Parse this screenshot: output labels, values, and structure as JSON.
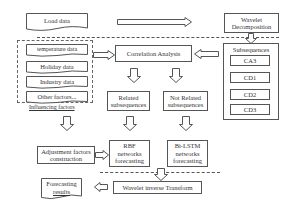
{
  "load_data": "Load data",
  "wavelet_decomposition": [
    "Wavelet",
    "Decomposition"
  ],
  "influencing": {
    "items": [
      "temperature data",
      "Holiday data",
      "Industry data",
      "Other factors..."
    ],
    "label": "Influencing factors"
  },
  "correlation_analysis": "Correlation Analysis",
  "subsequences": {
    "title": "Subsequences",
    "items": [
      "CA3",
      "CD1",
      "CD2",
      "CD3"
    ]
  },
  "related": [
    "Related",
    "subsequences"
  ],
  "not_related": [
    "Not Related",
    "subsequences"
  ],
  "adjustment": [
    "Adjustment factors",
    "construction"
  ],
  "rbf": [
    "RBF",
    "networks",
    "forecasting"
  ],
  "bilstm": [
    "Bi-LSTM",
    "networks",
    "forecasting"
  ],
  "wavelet_inverse": "Wavelet inverse Transform",
  "forecasting_results": [
    "Forecasting",
    "results"
  ],
  "colors": {
    "line": "#555555",
    "background": "#ffffff"
  }
}
